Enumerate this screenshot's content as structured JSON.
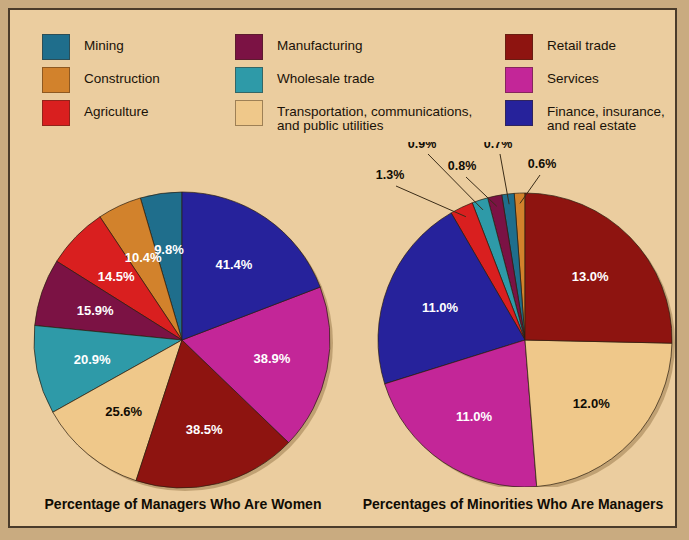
{
  "legend": {
    "columns": [
      {
        "items": [
          {
            "label": "Mining",
            "color": "#1f6e8c"
          },
          {
            "label": "Construction",
            "color": "#d2822c"
          },
          {
            "label": "Agriculture",
            "color": "#d91f1f"
          }
        ]
      },
      {
        "items": [
          {
            "label": "Manufacturing",
            "color": "#7b1244"
          },
          {
            "label": "Wholesale trade",
            "color": "#2e9aa8"
          },
          {
            "label": "Transportation, communications,\nand public utilities",
            "color": "#efc88a"
          }
        ]
      },
      {
        "items": [
          {
            "label": "Retail trade",
            "color": "#8e1410"
          },
          {
            "label": "Services",
            "color": "#c32698"
          },
          {
            "label": "Finance, insurance,\nand real estate",
            "color": "#26229b"
          }
        ]
      }
    ]
  },
  "chart_data": [
    {
      "type": "pie",
      "title": "Percentage of Managers Who Are Women",
      "labels": [
        "Mining",
        "Construction",
        "Agriculture",
        "Manufacturing",
        "Wholesale trade",
        "Transportation, communications, and public utilities",
        "Retail trade",
        "Services",
        "Finance, insurance, and real estate"
      ],
      "values": [
        9.8,
        10.4,
        14.5,
        15.9,
        20.9,
        25.6,
        38.5,
        38.9,
        41.4
      ],
      "value_labels": [
        "9.8%",
        "10.4%",
        "14.5%",
        "15.9%",
        "20.9%",
        "25.6%",
        "38.5%",
        "38.9%",
        "41.4%"
      ],
      "colors": [
        "#1f6e8c",
        "#d2822c",
        "#d91f1f",
        "#7b1244",
        "#2e9aa8",
        "#efc88a",
        "#8e1410",
        "#c32698",
        "#26229b"
      ],
      "label_colors": [
        "#ffffff",
        "#ffffff",
        "#ffffff",
        "#ffffff",
        "#ffffff",
        "#100c04",
        "#ffffff",
        "#ffffff",
        "#ffffff"
      ],
      "direction": "counterclockwise",
      "start_angle_deg": 0,
      "legend_position": "top"
    },
    {
      "type": "pie",
      "title": "Percentages of Minorities Who Are Managers",
      "labels": [
        "Construction",
        "Mining",
        "Manufacturing",
        "Wholesale trade",
        "Agriculture",
        "Finance, insurance, and real estate",
        "Services",
        "Transportation, communications, and public utilities",
        "Retail trade"
      ],
      "values": [
        0.6,
        0.7,
        0.8,
        0.9,
        1.3,
        11.0,
        11.0,
        12.0,
        13.0
      ],
      "value_labels": [
        "0.6%",
        "0.7%",
        "0.8%",
        "0.9%",
        "1.3%",
        "11.0%",
        "11.0%",
        "12.0%",
        "13.0%"
      ],
      "colors": [
        "#d2822c",
        "#1f6e8c",
        "#7b1244",
        "#2e9aa8",
        "#d91f1f",
        "#26229b",
        "#c32698",
        "#efc88a",
        "#8e1410"
      ],
      "label_colors": [
        "#100c04",
        "#100c04",
        "#100c04",
        "#100c04",
        "#100c04",
        "#ffffff",
        "#ffffff",
        "#100c04",
        "#ffffff"
      ],
      "callout_indices": [
        0,
        1,
        2,
        3,
        4
      ],
      "direction": "counterclockwise",
      "start_angle_deg": 0,
      "legend_position": "top"
    }
  ],
  "background_color": "#ebcd9f",
  "border_color": "#4a3b2a"
}
